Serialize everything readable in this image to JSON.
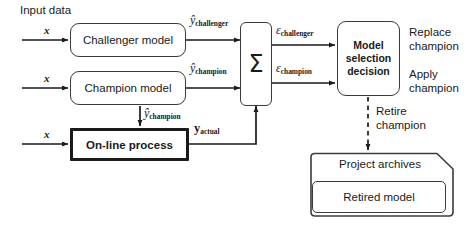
{
  "diagram": {
    "colors": {
      "stroke": "#3b3b3b",
      "thick_stroke": "#1a1a1a",
      "text": "#1a1a1a",
      "background": "#ffffff"
    },
    "input_caption": "Input data",
    "inputs": [
      {
        "label": "x"
      },
      {
        "label": "x"
      },
      {
        "label": "x"
      }
    ],
    "boxes": {
      "challenger_model": "Challenger model",
      "champion_model": "Champion model",
      "online_process": "On-line process",
      "summation": "Σ",
      "model_selection": {
        "line1": "Model",
        "line2": "selection",
        "line3": "decision"
      },
      "project_archives": "Project archives",
      "retired_model": "Retired model"
    },
    "signals": {
      "y_hat_challenger": {
        "symbol": "ŷ",
        "subscript": "challenger"
      },
      "y_hat_champion": {
        "symbol": "ŷ",
        "subscript": "champion"
      },
      "y_hat_champion_to_process": {
        "symbol": "ŷ",
        "subscript": "champion"
      },
      "y_actual": {
        "symbol": "y",
        "subscript": "actual"
      },
      "epsilon_challenger": {
        "symbol": "ε",
        "subscript": "challenger"
      },
      "epsilon_champion": {
        "symbol": "ε",
        "subscript": "champion"
      }
    },
    "outcomes": [
      {
        "line1": "Replace",
        "line2": "champion"
      },
      {
        "line1": "Apply",
        "line2": "champion"
      }
    ],
    "retire_label": {
      "line1": "Retire",
      "line2": "champion"
    }
  }
}
